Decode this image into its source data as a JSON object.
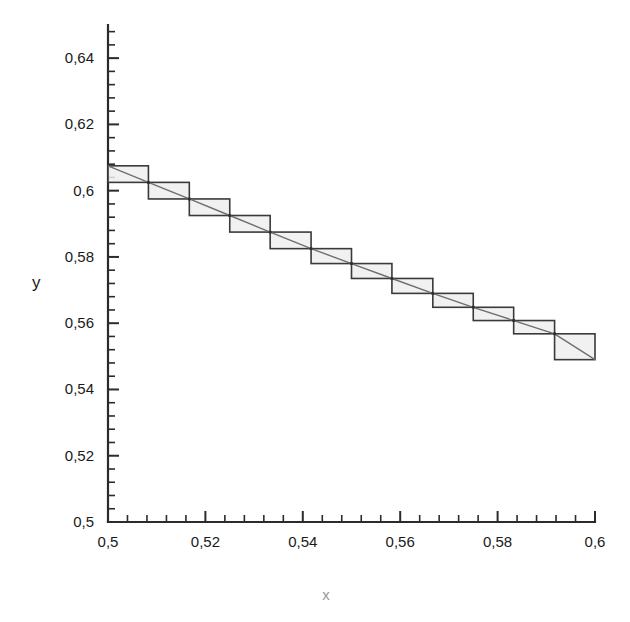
{
  "chart_data": {
    "type": "line",
    "title": "",
    "subtitle": "",
    "xlabel": "x",
    "ylabel": "y",
    "xlim": [
      0.5,
      0.6
    ],
    "ylim": [
      0.5,
      0.65
    ],
    "grid": false,
    "legend": null,
    "decimal_separator": ",",
    "x_ticks_major": [
      0.5,
      0.52,
      0.54,
      0.56,
      0.58,
      0.6
    ],
    "x_tick_labels": [
      "0,5",
      "0,52",
      "0,54",
      "0,56",
      "0,58",
      "0,6"
    ],
    "x_minor_per_major": 5,
    "y_ticks_major": [
      0.5,
      0.52,
      0.54,
      0.56,
      0.58,
      0.6,
      0.62,
      0.64
    ],
    "y_tick_labels": [
      "0,5",
      "0,52",
      "0,54",
      "0,56",
      "0,58",
      "0,6",
      "0,62",
      "0,64"
    ],
    "y_minor_per_major": 5,
    "series": [
      {
        "name": "step-solution",
        "style": "staircase-boxes",
        "fill_color": "#eeeeee",
        "stroke_color": "#3a3a3a",
        "steps": [
          {
            "x0": 0.5,
            "x1": 0.5083,
            "y_top": 0.6075,
            "y_bottom": 0.6025
          },
          {
            "x0": 0.5083,
            "x1": 0.5167,
            "y_top": 0.6025,
            "y_bottom": 0.5975
          },
          {
            "x0": 0.5167,
            "x1": 0.525,
            "y_top": 0.5975,
            "y_bottom": 0.5925
          },
          {
            "x0": 0.525,
            "x1": 0.5333,
            "y_top": 0.5925,
            "y_bottom": 0.5875
          },
          {
            "x0": 0.5333,
            "x1": 0.5417,
            "y_top": 0.5875,
            "y_bottom": 0.5825
          },
          {
            "x0": 0.5417,
            "x1": 0.55,
            "y_top": 0.5825,
            "y_bottom": 0.578
          },
          {
            "x0": 0.55,
            "x1": 0.5583,
            "y_top": 0.578,
            "y_bottom": 0.5735
          },
          {
            "x0": 0.5583,
            "x1": 0.5667,
            "y_top": 0.5735,
            "y_bottom": 0.569
          },
          {
            "x0": 0.5667,
            "x1": 0.575,
            "y_top": 0.569,
            "y_bottom": 0.5648
          },
          {
            "x0": 0.575,
            "x1": 0.5833,
            "y_top": 0.5648,
            "y_bottom": 0.5608
          },
          {
            "x0": 0.5833,
            "x1": 0.5917,
            "y_top": 0.5608,
            "y_bottom": 0.5568
          },
          {
            "x0": 0.5917,
            "x1": 0.6,
            "y_top": 0.5568,
            "y_bottom": 0.549
          }
        ]
      },
      {
        "name": "exact-curve",
        "style": "line",
        "stroke_color": "#6e6e6e",
        "x": [
          0.5,
          0.5083,
          0.5167,
          0.525,
          0.5333,
          0.5417,
          0.55,
          0.5583,
          0.5667,
          0.575,
          0.5833,
          0.5917,
          0.6
        ],
        "y": [
          0.6075,
          0.6025,
          0.5975,
          0.5925,
          0.5875,
          0.5825,
          0.578,
          0.5735,
          0.569,
          0.5648,
          0.5608,
          0.5568,
          0.549
        ]
      }
    ],
    "annotations": []
  },
  "axes": {
    "y_axis_label": "y",
    "x_axis_label": "x"
  }
}
